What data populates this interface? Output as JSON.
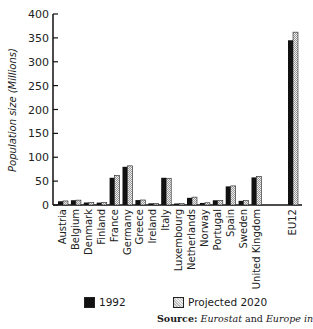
{
  "chart_data": {
    "type": "bar",
    "title": "",
    "xlabel": "",
    "ylabel": "Population size (Millions)",
    "ylim": [
      0,
      400
    ],
    "yticks": [
      0,
      50,
      100,
      150,
      200,
      250,
      300,
      350,
      400
    ],
    "grid": false,
    "legend_position": "bottom",
    "categories": [
      "Austria",
      "Belgium",
      "Denmark",
      "Finland",
      "France",
      "Germany",
      "Greece",
      "Ireland",
      "Italy",
      "Luxembourg",
      "Netherlands",
      "Norway",
      "Portugal",
      "Spain",
      "Sweden",
      "United Kingdom",
      "EU12"
    ],
    "series": [
      {
        "name": "1992",
        "values": [
          7.8,
          10,
          5.2,
          5,
          57,
          80,
          10.3,
          3.5,
          57,
          0.4,
          15,
          4.3,
          9.9,
          39,
          8.7,
          57.8,
          345
        ]
      },
      {
        "name": "Projected 2020",
        "values": [
          8.5,
          10.2,
          5.2,
          5.3,
          62,
          82,
          10.5,
          3.5,
          56,
          0.4,
          16.5,
          4.7,
          9.6,
          40,
          9.5,
          60,
          362
        ]
      }
    ]
  },
  "legend": {
    "item1": "1992",
    "item2": "Projected 2020"
  },
  "source": {
    "label": "Source:",
    "s1": "Eurostat",
    "and": " and ",
    "s2": "Europe in Figures"
  }
}
